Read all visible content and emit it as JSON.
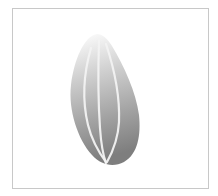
{
  "illustration": {
    "subject": "seed-icon",
    "caption": "",
    "colors": {
      "frame_border": "#c8c8c8",
      "background": "#ffffff",
      "gradient_top": "#ffffff",
      "gradient_mid": "#b4b4b4",
      "gradient_bottom": "#7e7e7e",
      "stripe": "#f2f2f2"
    }
  }
}
